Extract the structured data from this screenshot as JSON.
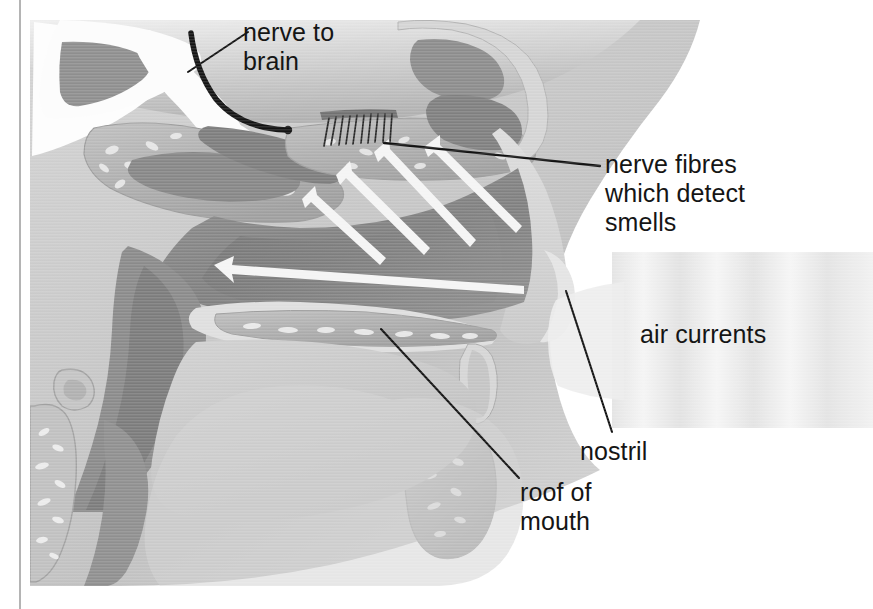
{
  "figure": {
    "background_color": "#ffffff",
    "rule_color": "#b4b4b4",
    "text_color": "#151515",
    "leader_color": "#111111"
  },
  "labels": {
    "nerve_to_brain": "nerve to\nbrain",
    "nerve_fibres": "nerve fibres\nwhich detect\nsmells",
    "air_currents": "air currents",
    "nostril": "nostril",
    "roof_of_mouth": "roof of\nmouth"
  },
  "anatomy": {
    "palette": {
      "page_white": "#ffffff",
      "skin_light": "#d9d9d9",
      "tissue_pale": "#c9c9c9",
      "bone_grey": "#a9a9a9",
      "bone_light": "#bdbdbd",
      "cavity_mid": "#979797",
      "cavity_dark": "#7e7e7e",
      "cavity_darker": "#6f6f6f",
      "brain_grey": "#bcbcbc",
      "airway_white": "#fdfdfd",
      "arrow_white": "#f2f2f2",
      "air_band": "#e6e6e6",
      "nerve_black": "#1a1a1a"
    },
    "structures": [
      "brain cavity",
      "frontal sinus",
      "nasal turbinates",
      "nasal cavity",
      "olfactory epithelium (nerve fibres)",
      "nostril",
      "hard palate (roof of mouth)",
      "tongue",
      "throat / pharynx",
      "cervical vertebrae"
    ]
  },
  "airflow": {
    "arrow_count_inhale": 4,
    "arrow_count_back": 1,
    "direction": "up and to the left toward the olfactory region",
    "air_current_band": {
      "stripes": 5,
      "description": "soft vertical banding entering the nostril"
    }
  }
}
